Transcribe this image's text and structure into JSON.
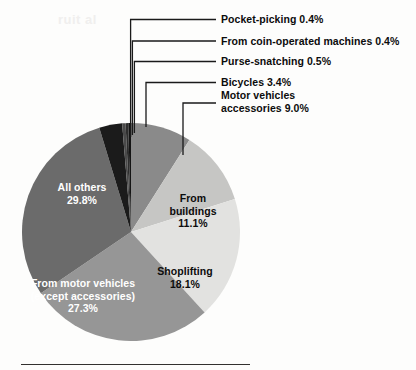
{
  "figure": {
    "background_color": "#fdfdfc",
    "bottom_rule_color": "#33312f"
  },
  "ghost_text": {
    "line1": "ruit al"
  },
  "callouts": [
    {
      "name": "pocket-picking",
      "text": "Pocket-picking 0.4%"
    },
    {
      "name": "coin-operated",
      "text": "From coin-operated machines 0.4%"
    },
    {
      "name": "purse-snatching",
      "text": "Purse-snatching 0.5%"
    },
    {
      "name": "bicycles",
      "text": "Bicycles 3.4%"
    },
    {
      "name": "motor-accessories-l1",
      "text": "Motor vehicles"
    },
    {
      "name": "motor-accessories-l2",
      "text": "accessories 9.0%"
    }
  ],
  "slice_labels": {
    "all_others": {
      "line1": "All others",
      "line2": "29.8%"
    },
    "from_buildings": {
      "line1": "From",
      "line2": "buildings",
      "line3": "11.1%"
    },
    "shoplifting": {
      "line1": "Shoplifting",
      "line2": "18.1%"
    },
    "from_motor_vehicles": {
      "line1": "From motor vehicles",
      "line2": "(except accessories)",
      "line3": "27.3%"
    }
  },
  "chart_data": {
    "type": "pie",
    "title": "",
    "subtitle": "",
    "xlabel": "",
    "ylabel": "",
    "units": "percent",
    "total": 100.0,
    "start_angle_deg": 0,
    "direction": "clockwise",
    "legend_position": "callouts-and-inline",
    "grid": false,
    "labels": [
      "Motor vehicles accessories",
      "From buildings",
      "Shoplifting",
      "From motor vehicles (except accessories)",
      "All others",
      "Bicycles",
      "Purse-snatching",
      "From coin-operated machines",
      "Pocket-picking"
    ],
    "values": [
      9.0,
      11.1,
      18.1,
      27.3,
      29.8,
      3.4,
      0.5,
      0.4,
      0.4
    ],
    "colors": [
      "#8a8a8a",
      "#c6c6c4",
      "#e2e2e0",
      "#969696",
      "#6b6b6b",
      "#1b1b1b",
      "#4a4a4a",
      "#2e2e2e",
      "#141414"
    ],
    "slices": [
      {
        "label": "Motor vehicles accessories",
        "value": 9.0,
        "color": "#8a8a8a",
        "label_placement": "callout"
      },
      {
        "label": "From buildings",
        "value": 11.1,
        "color": "#c6c6c4",
        "label_placement": "inside"
      },
      {
        "label": "Shoplifting",
        "value": 18.1,
        "color": "#e2e2e0",
        "label_placement": "inside"
      },
      {
        "label": "From motor vehicles (except accessories)",
        "value": 27.3,
        "color": "#969696",
        "label_placement": "inside"
      },
      {
        "label": "All others",
        "value": 29.8,
        "color": "#6b6b6b",
        "label_placement": "inside"
      },
      {
        "label": "Bicycles",
        "value": 3.4,
        "color": "#1b1b1b",
        "label_placement": "callout"
      },
      {
        "label": "Purse-snatching",
        "value": 0.5,
        "color": "#4a4a4a",
        "label_placement": "callout"
      },
      {
        "label": "From coin-operated machines",
        "value": 0.4,
        "color": "#2e2e2e",
        "label_placement": "callout"
      },
      {
        "label": "Pocket-picking",
        "value": 0.4,
        "color": "#141414",
        "label_placement": "callout"
      }
    ]
  }
}
